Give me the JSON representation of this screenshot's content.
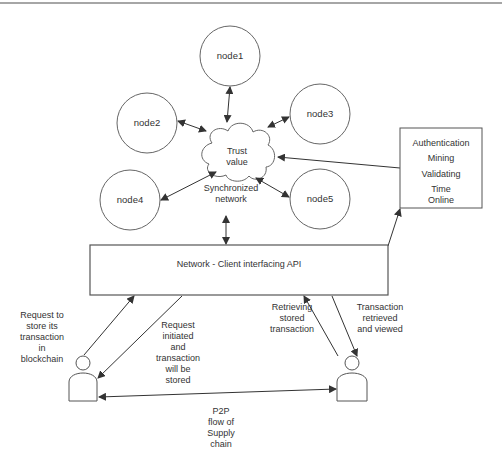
{
  "diagram": {
    "nodes": [
      {
        "id": "node1",
        "label": "node1"
      },
      {
        "id": "node2",
        "label": "node2"
      },
      {
        "id": "node3",
        "label": "node3"
      },
      {
        "id": "node4",
        "label": "node4"
      },
      {
        "id": "node5",
        "label": "node5"
      }
    ],
    "cloud": {
      "label_line1": "Trust",
      "label_line2": "value"
    },
    "sync_network": {
      "line1": "Synchronized",
      "line2": "network"
    },
    "metrics_box": {
      "items": [
        "Authentication",
        "Mining",
        "Validating",
        "Time",
        "Online"
      ]
    },
    "api": {
      "label": "Network - Client interfacing API"
    },
    "left_user": {
      "request_label": [
        "Request to",
        "store its",
        "transaction",
        "in",
        "blockchain"
      ],
      "response_label": [
        "Request",
        "initiated",
        "and",
        "transaction",
        "will be",
        "stored"
      ]
    },
    "right_user": {
      "request_label": [
        "Retrieving",
        "stored",
        "transaction"
      ],
      "response_label": [
        "Transaction",
        "retrieved",
        "and viewed"
      ]
    },
    "p2p": {
      "label": [
        "P2P",
        "flow of",
        "Supply",
        "chain"
      ]
    },
    "colors": {
      "stroke": "#555555",
      "text": "#333333",
      "background": "#ffffff"
    }
  }
}
